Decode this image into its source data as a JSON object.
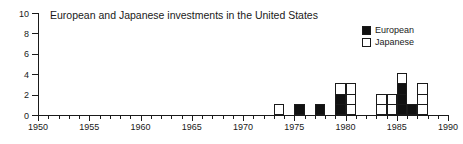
{
  "chart_data": {
    "type": "bar",
    "title": "European and Japanese investments in the United States",
    "xlabel": "",
    "ylabel": "",
    "xlim": [
      1950,
      1990
    ],
    "ylim": [
      0,
      10
    ],
    "grid": false,
    "stacked": true,
    "legend_position": "top-right",
    "x_tick_labels": [
      "1950",
      "1955",
      "1960",
      "1965",
      "1970",
      "1975",
      "1980",
      "1985",
      "1990"
    ],
    "x_tick_values": [
      1950,
      1955,
      1960,
      1965,
      1970,
      1975,
      1980,
      1985,
      1990
    ],
    "x_minor_tick_interval": 1,
    "y_tick_labels": [
      "0",
      "2",
      "4",
      "6",
      "8",
      "10"
    ],
    "y_tick_values": [
      0,
      2,
      4,
      6,
      8,
      10
    ],
    "categories": [
      1973,
      1975,
      1977,
      1979,
      1980,
      1983,
      1984,
      1985,
      1986,
      1987
    ],
    "series": [
      {
        "name": "European",
        "color": "#111111",
        "values": [
          0,
          1,
          1,
          2,
          0,
          0,
          0,
          3,
          1,
          0
        ]
      },
      {
        "name": "Japanese",
        "color": "#ffffff",
        "values": [
          1,
          0,
          0,
          1,
          3,
          2,
          2,
          1,
          0,
          3
        ]
      }
    ],
    "bars": [
      {
        "year": 1973,
        "european": 0,
        "japanese": 1,
        "total": 1
      },
      {
        "year": 1975,
        "european": 1,
        "japanese": 0,
        "total": 1
      },
      {
        "year": 1977,
        "european": 1,
        "japanese": 0,
        "total": 1
      },
      {
        "year": 1979,
        "european": 2,
        "japanese": 1,
        "total": 3
      },
      {
        "year": 1980,
        "european": 0,
        "japanese": 3,
        "total": 3
      },
      {
        "year": 1983,
        "european": 0,
        "japanese": 2,
        "total": 2
      },
      {
        "year": 1984,
        "european": 0,
        "japanese": 2,
        "total": 2
      },
      {
        "year": 1985,
        "european": 3,
        "japanese": 1,
        "total": 4
      },
      {
        "year": 1986,
        "european": 1,
        "japanese": 0,
        "total": 1
      },
      {
        "year": 1987,
        "european": 0,
        "japanese": 3,
        "total": 3
      }
    ]
  },
  "title": {
    "text": "European and Japanese investments in the United States"
  },
  "legend": {
    "items": [
      {
        "label": "European",
        "color": "#111111"
      },
      {
        "label": "Japanese",
        "color": "#ffffff"
      }
    ]
  },
  "axes": {
    "y": {
      "labels": [
        "10",
        "8",
        "6",
        "4",
        "2",
        "0"
      ],
      "values": [
        10,
        8,
        6,
        4,
        2,
        0
      ]
    },
    "x": {
      "labels": [
        "1950",
        "1955",
        "1960",
        "1965",
        "1970",
        "1975",
        "1980",
        "1985",
        "1990"
      ],
      "values": [
        1950,
        1955,
        1960,
        1965,
        1970,
        1975,
        1980,
        1985,
        1990
      ]
    }
  },
  "colors": {
    "european": "#111111",
    "japanese": "#ffffff",
    "axis": "#1a1a1a",
    "background": "#ffffff"
  }
}
